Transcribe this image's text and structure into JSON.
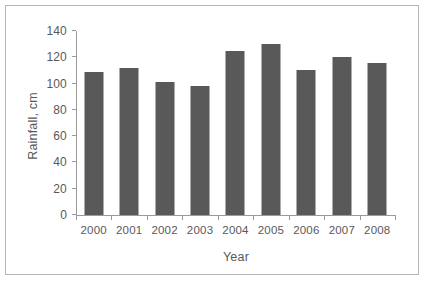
{
  "chart_data": {
    "type": "bar",
    "title": "",
    "xlabel": "Year",
    "ylabel": "Rainfall, cm",
    "categories": [
      "2000",
      "2001",
      "2002",
      "2003",
      "2004",
      "2005",
      "2006",
      "2007",
      "2008"
    ],
    "values": [
      109,
      112,
      101,
      98,
      125,
      130,
      110,
      120,
      116
    ],
    "ylim": [
      0,
      140
    ],
    "yticks": [
      0,
      20,
      40,
      60,
      80,
      100,
      120,
      140
    ],
    "ytick_labels": [
      "0",
      "20",
      "40",
      "60",
      "80",
      "100",
      "120",
      "140"
    ],
    "grid": false,
    "legend": false,
    "bar_color": "#595959",
    "axis_color": "#9a9a9a",
    "text_color": "#59595b",
    "background_color": "#ffffff",
    "border_color": "#b6b6b6"
  }
}
